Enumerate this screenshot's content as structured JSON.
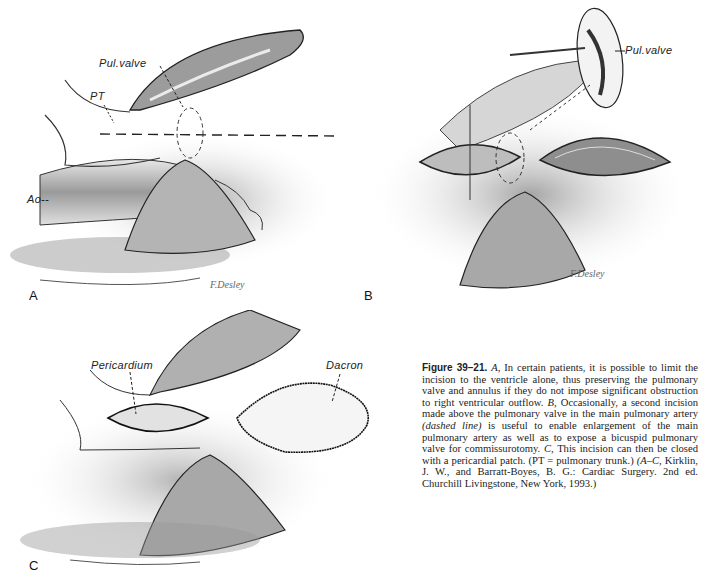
{
  "figure": {
    "number_label": "Figure 39–21.",
    "panels": [
      {
        "id": "A",
        "letter": "A",
        "annotations": [
          "Pul.valve",
          "PT",
          "Ao--"
        ],
        "signature": "F. Desley"
      },
      {
        "id": "B",
        "letter": "B",
        "annotations": [
          "Pul.valve"
        ],
        "signature": "F. Desley"
      },
      {
        "id": "C",
        "letter": "C",
        "annotations": [
          "Pericardium",
          "Dacron"
        ]
      }
    ],
    "caption": {
      "seg1_italic": "A,",
      "seg2": " In certain patients, it is possible to limit the incision to the ventricle alone, thus preserving the pulmonary valve and annulus if they do not impose significant obstruction to right ventricular outflow. ",
      "seg3_italic": "B,",
      "seg4": " Occasionally, a second incision made above the pulmonary valve in the main pulmonary artery ",
      "seg5_italic": "(dashed line)",
      "seg6": " is useful to enable enlargement of the main pulmonary artery as well as to expose a bicuspid pulmonary valve for commissurotomy. ",
      "seg7_italic": "C,",
      "seg8": " This incision can then be closed with a pericardial patch. (PT = pulmonary trunk.) ",
      "seg9_italic": "(A–C,",
      "seg10": " Kirklin, J. W., and Barratt-Boyes, B. G.: Cardiac Surgery. 2nd ed. Churchill Livingstone, New York, 1993.)"
    }
  }
}
